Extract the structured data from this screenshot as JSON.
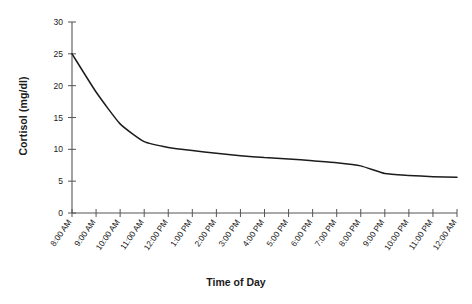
{
  "chart_data": {
    "type": "line",
    "title": "",
    "xlabel": "Time of Day",
    "ylabel": "Cortisol (mg/dl)",
    "ylim": [
      0,
      30
    ],
    "yticks": [
      0,
      5,
      10,
      15,
      20,
      25,
      30
    ],
    "grid": false,
    "legend": false,
    "categories": [
      "8:00 AM",
      "9:00 AM",
      "10:00 AM",
      "11:00 AM",
      "12:00 PM",
      "1:00 PM",
      "2:00 PM",
      "3:00 PM",
      "4:00 PM",
      "5:00 PM",
      "6:00 PM",
      "7:00 PM",
      "8:00 PM",
      "9:00 PM",
      "10:00 PM",
      "11:00 PM",
      "12:00 AM"
    ],
    "series": [
      {
        "name": "Cortisol",
        "values": [
          25.0,
          19.0,
          14.0,
          11.2,
          10.3,
          9.8,
          9.4,
          9.0,
          8.7,
          8.5,
          8.2,
          7.9,
          7.4,
          6.2,
          5.9,
          5.7,
          5.6
        ]
      }
    ]
  },
  "axis": {
    "y_tick_labels": [
      "0",
      "5",
      "10",
      "15",
      "20",
      "25",
      "30"
    ],
    "y_title": "Cortisol (mg/dl)",
    "x_title": "Time of Day",
    "x_tick_labels": [
      "8:00 AM",
      "9:00 AM",
      "10:00 AM",
      "11:00 AM",
      "12:00 PM",
      "1:00 PM",
      "2:00 PM",
      "3:00 PM",
      "4:00 PM",
      "5:00 PM",
      "6:00 PM",
      "7:00 PM",
      "8:00 PM",
      "9:00 PM",
      "10:00 PM",
      "11:00 PM",
      "12:00 AM"
    ]
  },
  "colors": {
    "series_line": "#1c1c1c",
    "axis": "#555555",
    "text": "#1a1a1a",
    "background": "#ffffff"
  }
}
